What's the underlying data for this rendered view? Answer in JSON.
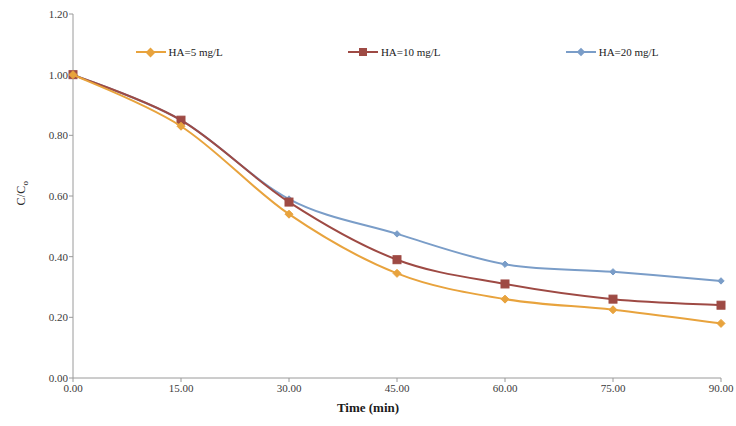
{
  "chart_data": {
    "type": "line",
    "title": "",
    "xlabel": "Time (min)",
    "ylabel": "C/C₀",
    "x": [
      0,
      15,
      30,
      45,
      60,
      75,
      90
    ],
    "xtick_labels": [
      "0.00",
      "15.00",
      "30.00",
      "45.00",
      "60.00",
      "75.00",
      "90.00"
    ],
    "ytick_labels": [
      "0.00",
      "0.20",
      "0.40",
      "0.60",
      "0.80",
      "1.00",
      "1.20"
    ],
    "ytick_values": [
      0.0,
      0.2,
      0.4,
      0.6,
      0.8,
      1.0,
      1.2
    ],
    "xlim": [
      0,
      90
    ],
    "ylim": [
      0,
      1.2
    ],
    "grid": false,
    "legend_position": "top-inside",
    "series": [
      {
        "name": "HA=5 mg/L",
        "color": "#E8A33D",
        "marker": "diamond",
        "values": [
          1.0,
          0.83,
          0.54,
          0.345,
          0.26,
          0.225,
          0.18
        ]
      },
      {
        "name": "HA=10 mg/L",
        "color": "#9E4A44",
        "marker": "square",
        "values": [
          1.0,
          0.85,
          0.58,
          0.39,
          0.31,
          0.26,
          0.24
        ]
      },
      {
        "name": "HA=20 mg/L",
        "color": "#7A9DC8",
        "marker": "diamond-small",
        "values": [
          1.0,
          0.85,
          0.59,
          0.475,
          0.375,
          0.35,
          0.32
        ]
      }
    ]
  },
  "axis": {
    "line_color": "#9a9a9a",
    "tick_color": "#3a3a3a"
  }
}
